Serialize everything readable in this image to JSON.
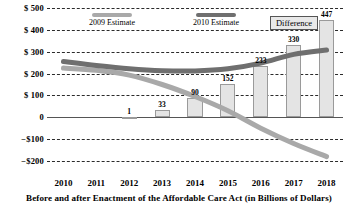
{
  "chart_data": {
    "type": "bar",
    "title": "",
    "subtitle": "",
    "xlabel": "Before and after Enactment of the Affordable Care Act (in Billions of Dollars)",
    "ylabel": "",
    "categories": [
      "2010",
      "2011",
      "2012",
      "2013",
      "2014",
      "2015",
      "2016",
      "2017",
      "2018"
    ],
    "ylim": [
      -200,
      500
    ],
    "yticks": [
      -200,
      -100,
      0,
      100,
      200,
      300,
      400,
      500
    ],
    "ytick_labels": [
      "−$200",
      "−$100",
      "0",
      "$ 100",
      "$ 200",
      "$ 300",
      "$ 400",
      "$ 500"
    ],
    "grid": true,
    "legend_position": "top",
    "series": [
      {
        "name": "Difference",
        "type": "bar",
        "values": [
          0,
          0,
          1,
          33,
          90,
          152,
          233,
          330,
          447
        ],
        "data_labels": [
          "",
          "",
          "1",
          "33",
          "90",
          "152",
          "233",
          "330",
          "447"
        ],
        "color": "#e4e4e4",
        "border_color": "#9a9a9a"
      },
      {
        "name": "2009 Estimate",
        "type": "line",
        "values": [
          225,
          215,
          193,
          150,
          95,
          30,
          -50,
          -120,
          -180
        ],
        "color": "#a9a9a9"
      },
      {
        "name": "2010 Estimate",
        "type": "line",
        "values": [
          255,
          237,
          222,
          213,
          212,
          222,
          248,
          288,
          308
        ],
        "color": "#6f6f6f"
      }
    ]
  },
  "legend": {
    "items": [
      {
        "label": "2009 Estimate",
        "swatch": "light-gray-bar",
        "boxed": false
      },
      {
        "label": "2010 Estimate",
        "swatch": "dark-gray-bar",
        "boxed": false
      },
      {
        "label": "Difference",
        "swatch": "none",
        "boxed": true
      }
    ]
  }
}
